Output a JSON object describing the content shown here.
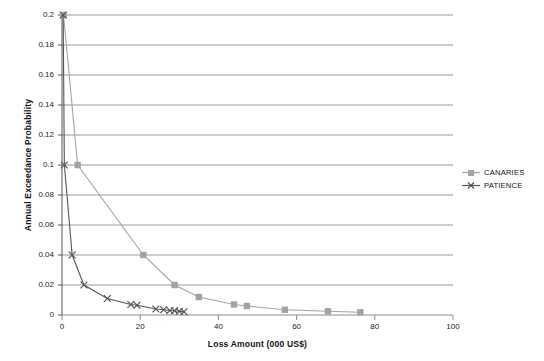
{
  "chart_data": {
    "type": "scatter",
    "title": "",
    "xlabel": "Loss Amount (000 US$)",
    "ylabel": "Annual Exceedance Probability",
    "xlim": [
      0,
      100
    ],
    "ylim": [
      0,
      0.2
    ],
    "xticks": [
      0,
      20,
      40,
      60,
      80,
      100
    ],
    "xtick_labels": [
      "0",
      "20",
      "40",
      "60",
      "80",
      "100"
    ],
    "yticks": [
      0,
      0.02,
      0.04,
      0.06,
      0.08,
      0.1,
      0.12,
      0.14,
      0.16,
      0.18,
      0.2
    ],
    "ytick_labels": [
      "0",
      "0.02",
      "0.04",
      "0.06",
      "0.08",
      "0.1",
      "0.12",
      "0.14",
      "0.16",
      "0.18",
      "0.2"
    ],
    "grid": "horizontal",
    "legend_position": "right",
    "series": [
      {
        "name": "CANARIES",
        "marker": "square",
        "color": "#a3a3a3",
        "points": [
          [
            0.4,
            0.2
          ],
          [
            4.0,
            0.1
          ],
          [
            20.8,
            0.04
          ],
          [
            28.8,
            0.02
          ],
          [
            35.0,
            0.012
          ],
          [
            44.0,
            0.007
          ],
          [
            47.3,
            0.006
          ],
          [
            57.0,
            0.0035
          ],
          [
            68.0,
            0.0025
          ],
          [
            76.3,
            0.0018
          ]
        ]
      },
      {
        "name": "PATIENCE",
        "marker": "x",
        "color": "#555555",
        "points": [
          [
            0.3,
            0.2
          ],
          [
            0.6,
            0.1
          ],
          [
            2.6,
            0.04
          ],
          [
            5.6,
            0.02
          ],
          [
            11.6,
            0.011
          ],
          [
            17.6,
            0.007
          ],
          [
            19.2,
            0.0065
          ],
          [
            24.0,
            0.004
          ],
          [
            26.0,
            0.0035
          ],
          [
            27.6,
            0.003
          ],
          [
            28.8,
            0.0028
          ],
          [
            30.0,
            0.0025
          ],
          [
            31.2,
            0.0022
          ]
        ]
      }
    ]
  },
  "legend": {
    "items": [
      {
        "label": "CANARIES"
      },
      {
        "label": "PATIENCE"
      }
    ]
  }
}
